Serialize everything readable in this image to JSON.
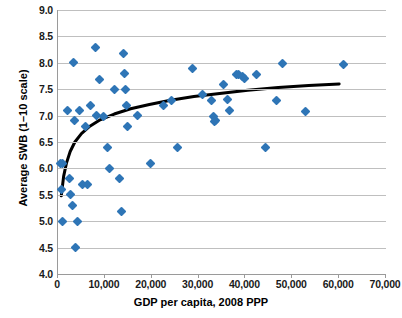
{
  "chart_data": {
    "type": "scatter",
    "title": "",
    "xlabel": "GDP per capita, 2008 PPP",
    "ylabel": "Average SWB (1–10 scale)",
    "xlim": [
      0,
      70000
    ],
    "ylim": [
      4.0,
      9.0
    ],
    "xticks": [
      0,
      10000,
      20000,
      30000,
      40000,
      50000,
      60000,
      70000
    ],
    "xtick_labels": [
      "0",
      "10,000",
      "20,000",
      "30,000",
      "40,000",
      "50,000",
      "60,000",
      "70,000"
    ],
    "yticks": [
      4.0,
      4.5,
      5.0,
      5.5,
      6.0,
      6.5,
      7.0,
      7.5,
      8.0,
      8.5,
      9.0
    ],
    "ytick_labels": [
      "4.0",
      "4.5",
      "5.0",
      "5.5",
      "6.0",
      "6.5",
      "7.0",
      "7.5",
      "8.0",
      "8.5",
      "9.0"
    ],
    "grid": true,
    "grid_axis": "y",
    "legend": false,
    "marker": "diamond",
    "marker_color": "#2E75B6",
    "trendline_color": "#000000",
    "series": [
      {
        "name": "Countries",
        "points": [
          [
            600,
            6.1
          ],
          [
            900,
            6.09
          ],
          [
            700,
            5.6
          ],
          [
            900,
            5.0
          ],
          [
            2100,
            7.1
          ],
          [
            2400,
            5.8
          ],
          [
            2600,
            5.5
          ],
          [
            3000,
            5.3
          ],
          [
            3300,
            8.0
          ],
          [
            3500,
            6.9
          ],
          [
            3800,
            4.5
          ],
          [
            4200,
            5.0
          ],
          [
            4600,
            7.1
          ],
          [
            5300,
            5.7
          ],
          [
            5800,
            6.8
          ],
          [
            6300,
            5.7
          ],
          [
            6900,
            7.2
          ],
          [
            8100,
            8.29
          ],
          [
            8300,
            7.0
          ],
          [
            8800,
            7.69
          ],
          [
            9700,
            6.99
          ],
          [
            10500,
            6.4
          ],
          [
            10900,
            6.0
          ],
          [
            12100,
            7.49
          ],
          [
            13100,
            5.8
          ],
          [
            13500,
            5.19
          ],
          [
            13900,
            8.18
          ],
          [
            14100,
            7.79
          ],
          [
            14300,
            7.49
          ],
          [
            14600,
            7.2
          ],
          [
            14900,
            6.8
          ],
          [
            16900,
            7.0
          ],
          [
            19800,
            6.09
          ],
          [
            22500,
            7.19
          ],
          [
            24200,
            7.29
          ],
          [
            25600,
            6.39
          ],
          [
            28600,
            7.89
          ],
          [
            30800,
            7.4
          ],
          [
            32800,
            7.29
          ],
          [
            33100,
            6.99
          ],
          [
            33300,
            6.89
          ],
          [
            33600,
            6.9
          ],
          [
            35400,
            7.58
          ],
          [
            36200,
            7.3
          ],
          [
            36600,
            7.09
          ],
          [
            38100,
            7.78
          ],
          [
            38600,
            7.77
          ],
          [
            39300,
            7.75
          ],
          [
            39900,
            7.7
          ],
          [
            42400,
            7.78
          ],
          [
            44300,
            6.39
          ],
          [
            46600,
            7.29
          ],
          [
            47900,
            7.98
          ],
          [
            52800,
            7.08
          ],
          [
            60900,
            7.97
          ]
        ]
      }
    ],
    "trendline": {
      "description": "logarithmic fit",
      "points": [
        [
          700,
          5.48
        ],
        [
          1200,
          5.85
        ],
        [
          1800,
          6.1
        ],
        [
          2600,
          6.32
        ],
        [
          3600,
          6.5
        ],
        [
          5000,
          6.66
        ],
        [
          6800,
          6.8
        ],
        [
          9000,
          6.92
        ],
        [
          12000,
          7.03
        ],
        [
          15500,
          7.13
        ],
        [
          19500,
          7.21
        ],
        [
          24000,
          7.29
        ],
        [
          29000,
          7.36
        ],
        [
          34500,
          7.42
        ],
        [
          40500,
          7.48
        ],
        [
          47000,
          7.53
        ],
        [
          53500,
          7.57
        ],
        [
          60000,
          7.6
        ]
      ]
    }
  }
}
